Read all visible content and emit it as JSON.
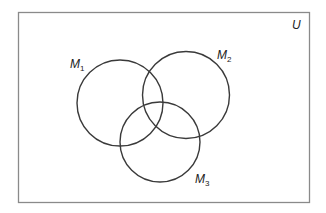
{
  "diagram": {
    "type": "venn",
    "universe_label": "U",
    "sets": [
      {
        "name": "M1",
        "base": "M",
        "sub": "1"
      },
      {
        "name": "M2",
        "base": "M",
        "sub": "2"
      },
      {
        "name": "M3",
        "base": "M",
        "sub": "3"
      }
    ],
    "colors": {
      "stroke": "#3a3a3a",
      "border": "#8a8a8a",
      "background": "#ffffff"
    }
  }
}
